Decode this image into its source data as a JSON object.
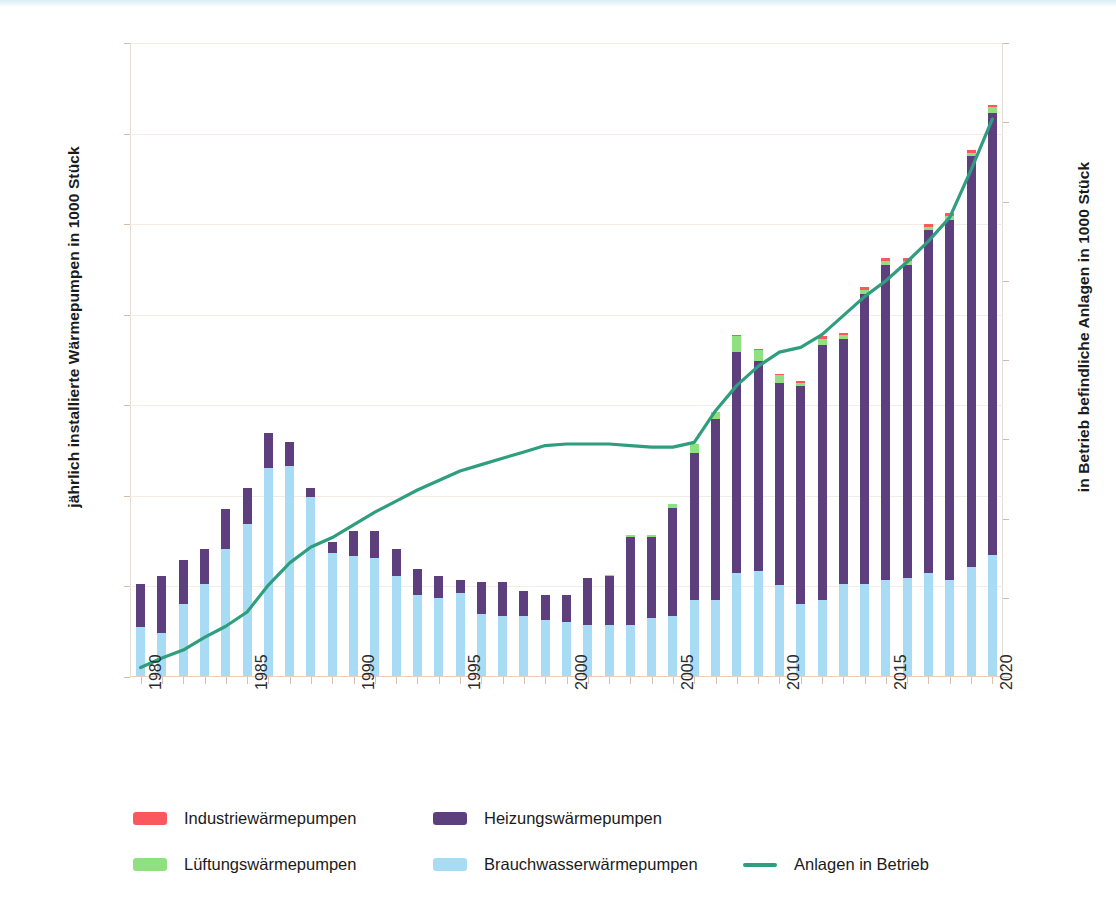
{
  "chart_data": {
    "type": "bar",
    "title": "",
    "subtitle": "",
    "xlabel": "",
    "ylabel": "jährlich installierte Wärmepumpen in 1000 Stück",
    "ylabel_right": "in Betrieb befindliche Anlagen in 1000 Stück",
    "ylim": [
      0,
      35
    ],
    "ylim_right": [
      0,
      400
    ],
    "yticks": [
      0,
      5,
      10,
      15,
      20,
      25,
      30,
      35
    ],
    "yticks_right": [
      0,
      50,
      100,
      150,
      200,
      250,
      300,
      350,
      400
    ],
    "grid": true,
    "legend_position": "bottom",
    "x": [
      1980,
      1981,
      1982,
      1983,
      1984,
      1985,
      1986,
      1987,
      1988,
      1989,
      1990,
      1991,
      1992,
      1993,
      1994,
      1995,
      1996,
      1997,
      1998,
      1999,
      2000,
      2001,
      2002,
      2003,
      2004,
      2005,
      2006,
      2007,
      2008,
      2009,
      2010,
      2011,
      2012,
      2013,
      2014,
      2015,
      2016,
      2017,
      2018,
      2019,
      2020
    ],
    "xtick_labels": [
      "1980",
      "1985",
      "1990",
      "1995",
      "2000",
      "2005",
      "2010",
      "2015",
      "2020"
    ],
    "xtick_years": [
      1980,
      1985,
      1990,
      1995,
      2000,
      2005,
      2010,
      2015,
      2020
    ],
    "stacked": true,
    "stack_order": [
      "Brauchwasserwärmepumpen",
      "Heizungswärmepumpen",
      "Lüftungswärmepumpen",
      "Industriewärmepumpen"
    ],
    "series": [
      {
        "name": "Brauchwasserwärmepumpen",
        "color": "#a8dcf5",
        "values": [
          2.7,
          2.4,
          4.0,
          5.1,
          7.0,
          8.4,
          11.5,
          11.6,
          9.9,
          6.8,
          6.6,
          6.5,
          5.5,
          4.5,
          4.3,
          4.6,
          3.4,
          3.3,
          3.3,
          3.1,
          3.0,
          2.8,
          2.8,
          2.8,
          3.2,
          3.3,
          4.2,
          4.2,
          5.7,
          5.8,
          5.0,
          4.0,
          4.2,
          5.1,
          5.1,
          5.3,
          5.4,
          5.7,
          5.3,
          6.0,
          6.7
        ]
      },
      {
        "name": "Heizungswärmepumpen",
        "color": "#5e3f7e",
        "values": [
          2.4,
          3.1,
          2.4,
          1.9,
          2.2,
          2.0,
          1.9,
          1.3,
          0.5,
          0.6,
          1.4,
          1.5,
          1.5,
          1.4,
          1.2,
          0.7,
          1.8,
          1.9,
          1.4,
          1.4,
          1.5,
          2.6,
          2.7,
          4.9,
          4.5,
          6.0,
          8.1,
          10.0,
          12.2,
          11.6,
          11.2,
          12.0,
          14.1,
          13.5,
          16.0,
          17.4,
          17.3,
          18.9,
          19.9,
          22.7,
          24.4
        ]
      },
      {
        "name": "Lüftungswärmepumpen",
        "color": "#8fe081",
        "values": [
          0,
          0,
          0,
          0,
          0,
          0,
          0,
          0,
          0,
          0,
          0,
          0,
          0,
          0,
          0,
          0,
          0,
          0,
          0,
          0,
          0,
          0,
          0.1,
          0.1,
          0.1,
          0.2,
          0.5,
          0.4,
          0.9,
          0.6,
          0.4,
          0.2,
          0.3,
          0.2,
          0.2,
          0.2,
          0.2,
          0.2,
          0.2,
          0.2,
          0.3
        ]
      },
      {
        "name": "Industriewärmepumpen",
        "color": "#f9595e",
        "values": [
          0,
          0,
          0,
          0,
          0,
          0,
          0,
          0,
          0,
          0,
          0,
          0,
          0,
          0,
          0,
          0,
          0,
          0,
          0,
          0,
          0,
          0,
          0,
          0,
          0,
          0,
          0,
          0,
          0.05,
          0.05,
          0.05,
          0.1,
          0.15,
          0.15,
          0.15,
          0.15,
          0.15,
          0.15,
          0.15,
          0.15,
          0.15
        ]
      }
    ],
    "line_series": {
      "name": "Anlagen in Betrieb",
      "color": "#2e9e7e",
      "axis": "right",
      "values": [
        6,
        12,
        17,
        25,
        32,
        41,
        58,
        72,
        82,
        88,
        96,
        104,
        111,
        118,
        124,
        130,
        134,
        138,
        142,
        146,
        147,
        147,
        147,
        146,
        145,
        145,
        148,
        168,
        184,
        196,
        205,
        208,
        216,
        228,
        240,
        250,
        262,
        275,
        290,
        320,
        352
      ]
    }
  },
  "legend": {
    "items": [
      {
        "label": "Industriewärmepumpen",
        "color": "#f9595e",
        "type": "swatch"
      },
      {
        "label": "Heizungswärmepumpen",
        "color": "#5e3f7e",
        "type": "swatch"
      },
      {
        "label": "Lüftungswärmepumpen",
        "color": "#8fe081",
        "type": "swatch"
      },
      {
        "label": "Brauchwasserwärmepumpen",
        "color": "#a8dcf5",
        "type": "swatch"
      },
      {
        "label": "Anlagen in Betrieb",
        "color": "#2e9e7e",
        "type": "line"
      }
    ]
  },
  "colors": {
    "industrie": "#f9595e",
    "heizung": "#5e3f7e",
    "lueftung": "#8fe081",
    "brauchwasser": "#a8dcf5",
    "line": "#2e9e7e",
    "grid": "#f3ece2",
    "text": "#1b1b1b"
  }
}
